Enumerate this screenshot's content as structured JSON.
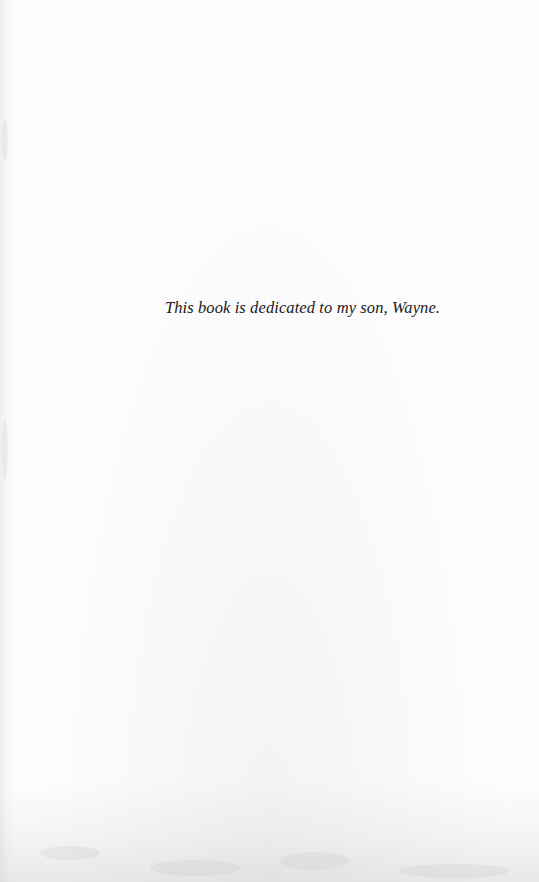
{
  "document": {
    "type": "dedication-page",
    "dedication_text": "This book is dedicated to my son, Wayne."
  },
  "colors": {
    "paper": "#fdfdfd",
    "text": "#1a1a1a",
    "scan_shadow": "#c8c8c8"
  }
}
